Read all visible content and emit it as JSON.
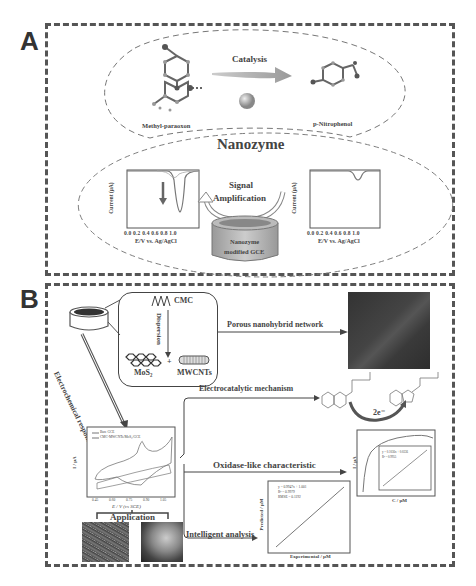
{
  "panel_a": {
    "letter": "A",
    "catalysis_label": "Catalysis",
    "reactant_label": "Methyl-paraoxon",
    "product_label": "p-Nitrophenol",
    "nanozyme_label": "Nanozyme",
    "signal_label_1": "Signal",
    "signal_label_2": "Amplification",
    "electrode_label_1": "Nanozyme",
    "electrode_label_2": "modified GCE",
    "plot_left": {
      "ylabel": "Current (μA)",
      "xlabel": "E/V vs. Ag/AgCl",
      "xticks": [
        "0.0",
        "0.2",
        "0.4",
        "0.6",
        "0.8",
        "1.0"
      ],
      "yticks": [
        "0",
        "-1",
        "-2",
        "-3",
        "-4",
        "-5"
      ]
    },
    "plot_right": {
      "ylabel": "Current (μA)",
      "xlabel": "E/V vs. Ag/AgCl",
      "xticks": [
        "0.0",
        "0.2",
        "0.4",
        "0.6",
        "0.8",
        "1.0"
      ],
      "yticks": [
        "0",
        "-1",
        "-2",
        "-3",
        "-4",
        "-5"
      ]
    }
  },
  "panel_b": {
    "letter": "B",
    "cmc_label": "CMC",
    "dispersion_label": "Dispersion",
    "mos2_label": "MoS₂",
    "plus": "+",
    "mwcnts_label": "MWCNTs",
    "porous_label": "Porous nanohybrid network",
    "electrochem_label": "Electrochemical response",
    "electrocatalytic_label": "Electrocatalytic mechanism",
    "electrons_label": "2e⁻",
    "oxidase_label": "Oxidase-like characteristic",
    "intelligent_label": "Intelligent analysis",
    "application_label": "Application",
    "cv_plot": {
      "legend": [
        "Bare GCE",
        "CMC-MWCNTs/MoS₂/GCE"
      ],
      "ylabel": "I / μA",
      "xlabel": "E / V (vs SCE)",
      "xticks": [
        "0.45",
        "0.60",
        "0.75",
        "0.90",
        "1.05"
      ],
      "yticks": [
        "15",
        "10",
        "5",
        "0",
        "-5",
        "-10"
      ]
    },
    "kinetics_plot": {
      "ylabel": "I / μA",
      "xlabel": "C / μM",
      "inset_eq": "y = 0.1036x + 0.0336",
      "inset_r2": "R² = 0.9955",
      "inset_ylabel": "1/I",
      "inset_xlabel": "1/C"
    },
    "prediction_plot": {
      "ylabel": "Predicted / μM",
      "xlabel": "Experimental / μM",
      "eq": "y = 0.9947x + 1.001",
      "r2": "R² = 0.9979",
      "rmse": "RMSE = 0.1192"
    }
  }
}
